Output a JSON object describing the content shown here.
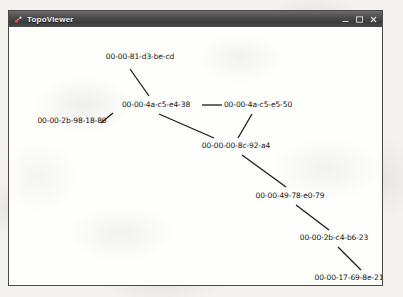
{
  "window": {
    "title": "TopoViewer",
    "icon": "app-icon",
    "controls": [
      {
        "name": "minimize",
        "label": "–"
      },
      {
        "name": "maximize",
        "label": "□"
      },
      {
        "name": "close",
        "label": "×"
      }
    ]
  },
  "colors": {
    "titlebar_start": "#6b6b6b",
    "titlebar_end": "#3b3b3b",
    "window_border": "#4a4a4a",
    "canvas_bg": "#fdfdfc",
    "edge": "#1a1a1a",
    "label_text": "#141414",
    "page_bg": "#f3f2ef"
  },
  "chart_data": {
    "type": "diagram",
    "title": "TopoViewer",
    "nodes": [
      {
        "id": "n1",
        "label": "00-00-81-d3-be-cd",
        "x": 131,
        "y": 30
      },
      {
        "id": "n2",
        "label": "00-00-4a-c5-e4-38",
        "x": 147,
        "y": 78
      },
      {
        "id": "n3",
        "label": "00-00-4a-c5-e5-50",
        "x": 249,
        "y": 78
      },
      {
        "id": "n4",
        "label": "00-00-2b-98-18-80",
        "x": 63,
        "y": 94
      },
      {
        "id": "n5",
        "label": "00-00-00-8c-92-a4",
        "x": 227,
        "y": 119
      },
      {
        "id": "n6",
        "label": "00-00-49-78-e0-79",
        "x": 281,
        "y": 169
      },
      {
        "id": "n7",
        "label": "00-00-2b-c4-b6-23",
        "x": 325,
        "y": 211
      },
      {
        "id": "n8",
        "label": "00-00-17-69-8e-21",
        "x": 340,
        "y": 251
      }
    ],
    "edges": [
      {
        "from": "n1",
        "to": "n2",
        "x1": 121,
        "y1": 42,
        "x2": 140,
        "y2": 69
      },
      {
        "from": "n2",
        "to": "n4",
        "x1": 104,
        "y1": 86,
        "x2": 92,
        "y2": 96
      },
      {
        "from": "n2",
        "to": "n3",
        "x1": 193,
        "y1": 78,
        "x2": 213,
        "y2": 78
      },
      {
        "from": "n2",
        "to": "n5",
        "x1": 150,
        "y1": 87,
        "x2": 205,
        "y2": 111
      },
      {
        "from": "n3",
        "to": "n5",
        "x1": 243,
        "y1": 87,
        "x2": 229,
        "y2": 111
      },
      {
        "from": "n5",
        "to": "n6",
        "x1": 233,
        "y1": 128,
        "x2": 277,
        "y2": 160
      },
      {
        "from": "n6",
        "to": "n7",
        "x1": 287,
        "y1": 178,
        "x2": 320,
        "y2": 203
      },
      {
        "from": "n7",
        "to": "n8",
        "x1": 329,
        "y1": 220,
        "x2": 352,
        "y2": 243
      }
    ]
  }
}
